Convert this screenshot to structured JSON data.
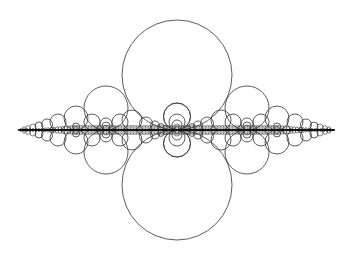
{
  "diagram": {
    "type": "circle-packing-fractal",
    "background": "#ffffff",
    "stroke_color": "#333333",
    "axis": {
      "y": 130,
      "x_start": 19,
      "x_end": 334
    },
    "large_circles": [
      {
        "cx": 177,
        "cy": 75,
        "r": 55
      },
      {
        "cx": 177,
        "cy": 185,
        "r": 55
      }
    ],
    "axis_circle_pairs": [
      {
        "cx": 106,
        "r": 22
      },
      {
        "cx": 247,
        "r": 22
      },
      {
        "cx": 76,
        "r": 12
      },
      {
        "cx": 277,
        "r": 12
      },
      {
        "cx": 58,
        "r": 8
      },
      {
        "cx": 295,
        "r": 8
      },
      {
        "cx": 47,
        "r": 5.5
      },
      {
        "cx": 306,
        "r": 5.5
      },
      {
        "cx": 39,
        "r": 4
      },
      {
        "cx": 314,
        "r": 4
      },
      {
        "cx": 33,
        "r": 3
      },
      {
        "cx": 320,
        "r": 3
      },
      {
        "cx": 28,
        "r": 2.2
      },
      {
        "cx": 325,
        "r": 2.2
      },
      {
        "cx": 24,
        "r": 1.6
      },
      {
        "cx": 329,
        "r": 1.6
      },
      {
        "cx": 132,
        "r": 10
      },
      {
        "cx": 221,
        "r": 10
      },
      {
        "cx": 146,
        "r": 6.5
      },
      {
        "cx": 207,
        "r": 6.5
      },
      {
        "cx": 155,
        "r": 4.5
      },
      {
        "cx": 198,
        "r": 4.5
      },
      {
        "cx": 161,
        "r": 3.2
      },
      {
        "cx": 192,
        "r": 3.2
      },
      {
        "cx": 165,
        "r": 2.3
      },
      {
        "cx": 188,
        "r": 2.3
      },
      {
        "cx": 92,
        "r": 8
      },
      {
        "cx": 120,
        "r": 8
      },
      {
        "cx": 233,
        "r": 8
      },
      {
        "cx": 261,
        "r": 8
      },
      {
        "cx": 177,
        "r": 13.5
      }
    ],
    "nested_at": [
      {
        "cx": 177,
        "radii": [
          13.5,
          8,
          5,
          3,
          1.8
        ]
      },
      {
        "cx": 106,
        "radii": [
          6,
          4,
          2.5
        ]
      },
      {
        "cx": 247,
        "radii": [
          6,
          4,
          2.5
        ]
      },
      {
        "cx": 76,
        "radii": [
          3.5,
          2
        ]
      },
      {
        "cx": 277,
        "radii": [
          3.5,
          2
        ]
      }
    ]
  }
}
